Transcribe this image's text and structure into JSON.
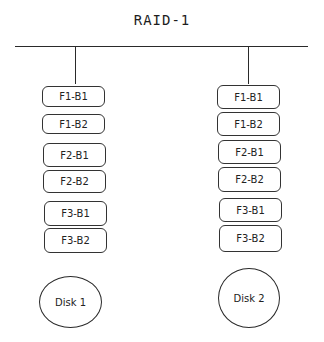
{
  "diagram": {
    "title": "RAID-1",
    "columns": [
      {
        "name": "disk-1",
        "blocks": [
          "F1-B1",
          "F1-B2",
          "F2-B1",
          "F2-B2",
          "F3-B1",
          "F3-B2"
        ],
        "disk_label": "Disk 1"
      },
      {
        "name": "disk-2",
        "blocks": [
          "F1-B1",
          "F1-B2",
          "F2-B1",
          "F2-B2",
          "F3-B1",
          "F3-B2"
        ],
        "disk_label": "Disk 2"
      }
    ],
    "colors": {
      "stroke": "#2a2a2a",
      "background": "#ffffff",
      "text": "#222222"
    }
  }
}
